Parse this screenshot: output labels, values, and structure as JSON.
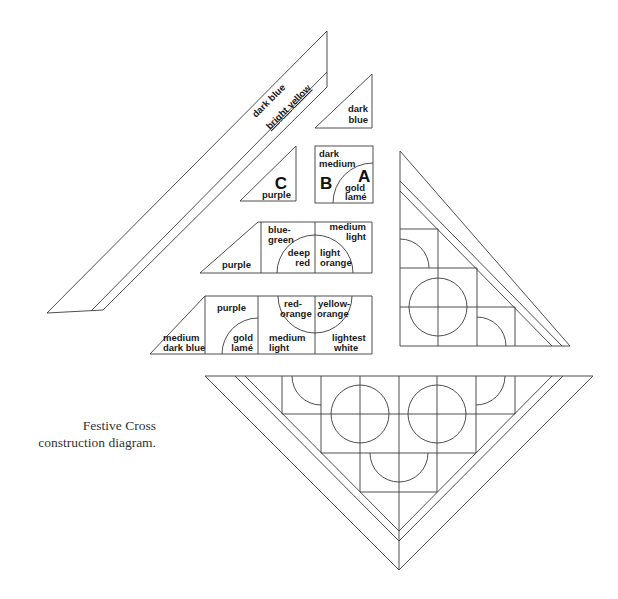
{
  "caption": {
    "line1": "Festive Cross",
    "line2": "construction diagram."
  },
  "pieces": {
    "long_strip": {
      "outer": "dark blue",
      "inner": "bright yellow"
    },
    "small_triangle": {
      "line1": "dark",
      "line2": "blue"
    },
    "triangle_c": {
      "letter": "C",
      "color": "purple"
    },
    "square_ab": {
      "letter_b": "B",
      "letter_a": "A",
      "b_color_line1": "dark",
      "b_color_line2": "medium",
      "a_color_line1": "gold",
      "a_color_line2": "lamé"
    },
    "middle_row": {
      "triangle": "purple",
      "cell1_line1": "blue-",
      "cell1_line2": "green",
      "arc1_line1": "deep",
      "arc1_line2": "red",
      "cell2_line1": "medium",
      "cell2_line2": "light",
      "arc2_line1": "light",
      "arc2_line2": "orange"
    },
    "bottom_row": {
      "triangle_line1": "medium",
      "triangle_line2": "dark blue",
      "cell1_top": "purple",
      "cell1_arc_line1": "gold",
      "cell1_arc_line2": "lamé",
      "arc1_line1": "red-",
      "arc1_line2": "orange",
      "cell2_line1": "medium",
      "cell2_line2": "light",
      "arc2_line1": "yellow-",
      "arc2_line2": "orange",
      "cell3_line1": "lightest",
      "cell3_line2": "white"
    }
  }
}
